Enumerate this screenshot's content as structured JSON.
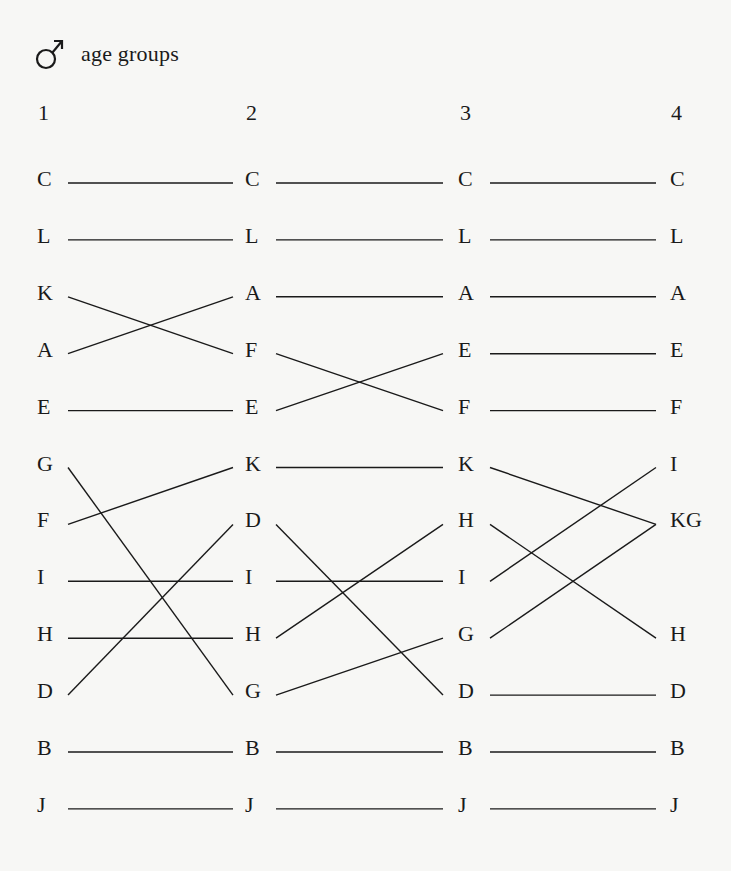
{
  "title": {
    "icon": "male-symbol-icon",
    "text": "age groups"
  },
  "columns": [
    {
      "header": "1",
      "items": [
        "C",
        "L",
        "K",
        "A",
        "E",
        "G",
        "F",
        "I",
        "H",
        "D",
        "B",
        "J"
      ]
    },
    {
      "header": "2",
      "items": [
        "C",
        "L",
        "A",
        "F",
        "E",
        "K",
        "D",
        "I",
        "H",
        "G",
        "B",
        "J"
      ]
    },
    {
      "header": "3",
      "items": [
        "C",
        "L",
        "A",
        "E",
        "F",
        "K",
        "H",
        "I",
        "G",
        "D",
        "B",
        "J"
      ]
    },
    {
      "header": "4",
      "items": [
        "C",
        "L",
        "A",
        "E",
        "F",
        "I",
        "KG",
        "",
        "H",
        "D",
        "B",
        "J"
      ]
    }
  ],
  "connections": [
    [
      [
        0,
        0
      ],
      [
        1,
        1
      ],
      [
        2,
        3
      ],
      [
        3,
        2
      ],
      [
        4,
        4
      ],
      [
        5,
        9
      ],
      [
        6,
        5
      ],
      [
        7,
        7
      ],
      [
        8,
        8
      ],
      [
        9,
        6
      ],
      [
        10,
        10
      ],
      [
        11,
        11
      ]
    ],
    [
      [
        0,
        0
      ],
      [
        1,
        1
      ],
      [
        2,
        2
      ],
      [
        3,
        4
      ],
      [
        4,
        3
      ],
      [
        5,
        5
      ],
      [
        6,
        9
      ],
      [
        7,
        7
      ],
      [
        8,
        6
      ],
      [
        9,
        8
      ],
      [
        10,
        10
      ],
      [
        11,
        11
      ]
    ],
    [
      [
        0,
        0
      ],
      [
        1,
        1
      ],
      [
        2,
        2
      ],
      [
        3,
        3
      ],
      [
        4,
        4
      ],
      [
        5,
        6
      ],
      [
        6,
        8
      ],
      [
        7,
        5
      ],
      [
        8,
        6
      ],
      [
        9,
        9
      ],
      [
        10,
        10
      ],
      [
        11,
        11
      ]
    ]
  ],
  "colors": {
    "background": "#f7f7f5",
    "ink": "#1a1a1a"
  }
}
